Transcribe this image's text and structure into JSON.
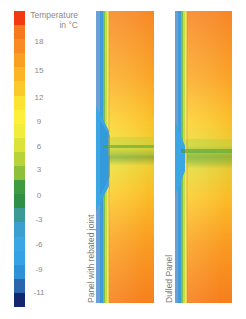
{
  "legend": {
    "title_line1": "Temperature",
    "title_line2": "in °C",
    "ticks": [
      {
        "label": "18",
        "y": 41
      },
      {
        "label": "15",
        "y": 70
      },
      {
        "label": "12",
        "y": 97
      },
      {
        "label": "9",
        "y": 121
      },
      {
        "label": "6",
        "y": 146
      },
      {
        "label": "3",
        "y": 169
      },
      {
        "label": "0",
        "y": 195
      },
      {
        "label": "-3",
        "y": 219
      },
      {
        "label": "-6",
        "y": 244
      },
      {
        "label": "-9",
        "y": 269
      },
      {
        "label": "-11",
        "y": 292
      }
    ],
    "colors": [
      "#f23a12",
      "#f7791f",
      "#f88b22",
      "#f9a023",
      "#fbb526",
      "#fcc92a",
      "#fde331",
      "#fdef3a",
      "#f2ec3c",
      "#dbe33b",
      "#b9d23a",
      "#8ebf3a",
      "#3f9b3f",
      "#2f8f45",
      "#3c9a95",
      "#3b9fd0",
      "#3aa6e4",
      "#36a2e5",
      "#2f92d6",
      "#2b66ad",
      "#14276e"
    ]
  },
  "panels": [
    {
      "label": "Panel with rebated joint"
    },
    {
      "label": "Dulled Panel"
    }
  ],
  "chart_data": {
    "type": "heatmap",
    "legend_title": "Temperature in °C",
    "scale_ticks": [
      18,
      15,
      12,
      9,
      6,
      3,
      0,
      -3,
      -6,
      -9,
      -11
    ],
    "scale_range": [
      -11,
      21
    ],
    "panels": [
      "Panel with rebated joint",
      "Dulled Panel"
    ]
  }
}
